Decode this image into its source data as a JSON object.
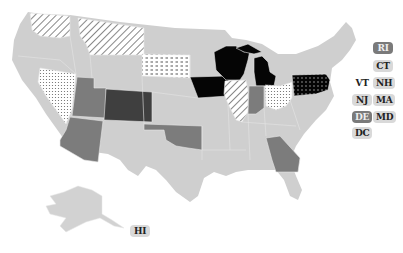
{
  "map": {
    "title": "",
    "colors": {
      "default": "#cfcfcf",
      "medium": "#7c7c7c",
      "dark": "#3f3f3f",
      "black": "#050505",
      "background": "#ffffff"
    },
    "patterns": [
      "diagonal-hatch",
      "dots",
      "dashes",
      "dark-dots"
    ],
    "states": [
      {
        "id": "WA",
        "fill": "diagonal-hatch"
      },
      {
        "id": "MT",
        "fill": "diagonal-hatch"
      },
      {
        "id": "SD",
        "fill": "dashes"
      },
      {
        "id": "NV",
        "fill": "dots"
      },
      {
        "id": "UT",
        "fill": "medium"
      },
      {
        "id": "CO",
        "fill": "dark"
      },
      {
        "id": "AZ",
        "fill": "medium"
      },
      {
        "id": "OK",
        "fill": "medium"
      },
      {
        "id": "IA",
        "fill": "black"
      },
      {
        "id": "WI",
        "fill": "black"
      },
      {
        "id": "MI",
        "fill": "black"
      },
      {
        "id": "IL",
        "fill": "diagonal-hatch"
      },
      {
        "id": "IN",
        "fill": "medium"
      },
      {
        "id": "OH",
        "fill": "dots"
      },
      {
        "id": "PA",
        "fill": "dark-dots"
      },
      {
        "id": "GA",
        "fill": "medium"
      }
    ],
    "small_state_labels": [
      {
        "label": "RI",
        "style": "dark"
      },
      {
        "label": "CT",
        "style": "light"
      },
      {
        "label": "VT",
        "style": "plain"
      },
      {
        "label": "NH",
        "style": "light"
      },
      {
        "label": "NJ",
        "style": "light"
      },
      {
        "label": "MA",
        "style": "light"
      },
      {
        "label": "DE",
        "style": "dark"
      },
      {
        "label": "MD",
        "style": "light"
      },
      {
        "label": "DC",
        "style": "light"
      },
      {
        "label": "HI",
        "style": "light"
      }
    ]
  }
}
